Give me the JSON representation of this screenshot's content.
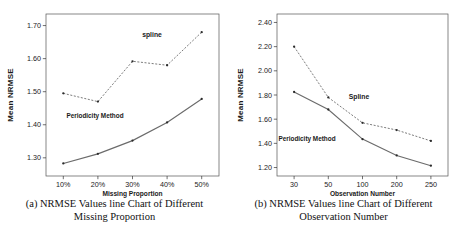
{
  "figure": {
    "panels": [
      {
        "id": "panel-a",
        "caption_line1": "(a) NRMSE Values line Chart of Different",
        "caption_line2": "Missing Proportion"
      },
      {
        "id": "panel-b",
        "caption_line1": "(b) NRMSE Values line Chart of Different",
        "caption_line2": "Observation Number"
      }
    ]
  },
  "chart_data": [
    {
      "type": "line",
      "id": "chart-a",
      "title": "",
      "xlabel": "Missing Proportion",
      "ylabel": "Mean NRMSE",
      "categories": [
        "10%",
        "20%",
        "30%",
        "40%",
        "50%"
      ],
      "yticks": [
        "1.30",
        "1.40",
        "1.50",
        "1.60",
        "1.70"
      ],
      "ylim": [
        1.245,
        1.735
      ],
      "grid": false,
      "legend_position": "inline-annotation",
      "series": [
        {
          "name": "spline",
          "label": "spline",
          "style": "dashed",
          "marker": "dot",
          "values": [
            1.495,
            1.47,
            1.592,
            1.58,
            1.68
          ]
        },
        {
          "name": "Periodicity Method",
          "label": "Periodicity Method",
          "style": "solid",
          "marker": "dot",
          "values": [
            1.283,
            1.312,
            1.352,
            1.407,
            1.478
          ]
        }
      ]
    },
    {
      "type": "line",
      "id": "chart-b",
      "title": "",
      "xlabel": "Observation Number",
      "ylabel": "Mean NRMSE",
      "categories": [
        "30",
        "50",
        "100",
        "200",
        "250"
      ],
      "yticks": [
        "1.20",
        "1.40",
        "1.60",
        "1.80",
        "2.00",
        "2.20",
        "2.40"
      ],
      "ylim": [
        1.13,
        2.47
      ],
      "grid": false,
      "legend_position": "inline-annotation",
      "series": [
        {
          "name": "Spline",
          "label": "Spline",
          "style": "dashed",
          "marker": "dot",
          "values": [
            2.2,
            1.78,
            1.57,
            1.51,
            1.42
          ]
        },
        {
          "name": "Periodicity Method",
          "label": "Periodicity Method",
          "style": "solid",
          "marker": "dot",
          "values": [
            1.825,
            1.68,
            1.435,
            1.3,
            1.215
          ]
        }
      ]
    }
  ]
}
